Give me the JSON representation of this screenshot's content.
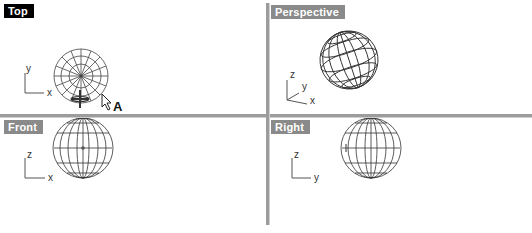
{
  "viewports": [
    {
      "id": "top",
      "label": "Top",
      "active": true,
      "axes": [
        "x",
        "y"
      ]
    },
    {
      "id": "perspective",
      "label": "Perspective",
      "active": false,
      "axes": [
        "x",
        "y",
        "z"
      ]
    },
    {
      "id": "front",
      "label": "Front",
      "active": false,
      "axes": [
        "x",
        "z"
      ]
    },
    {
      "id": "right",
      "label": "Right",
      "active": false,
      "axes": [
        "y",
        "z"
      ]
    }
  ],
  "annotations": {
    "pointer_label": "A"
  },
  "colors": {
    "active_label_bg": "#000000",
    "inactive_label_bg": "#8a8a8a",
    "divider": "#9c9c9c",
    "wire": "#333333"
  }
}
